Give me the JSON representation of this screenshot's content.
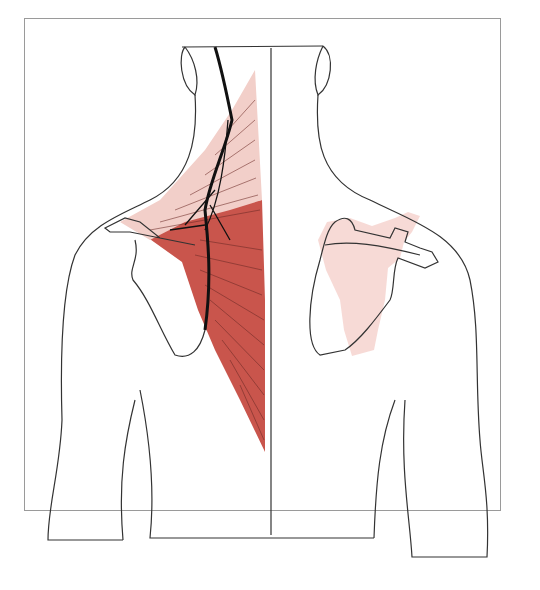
{
  "figure": {
    "type": "anatomical-illustration",
    "view": "posterior neck and shoulders",
    "panels": [
      {
        "side": "left",
        "content": "trapezius muscle with accessory nerve",
        "colors": {
          "muscle_upper": "#f2cfc9",
          "muscle_lower": "#c9554c",
          "nerve": "#1a1a1a"
        }
      },
      {
        "side": "right",
        "content": "scapula outline with referred pain zone",
        "colors": {
          "pain_zone": "#f6d6d2"
        }
      }
    ],
    "outline_color": "#333333",
    "frame_color": "#9a9a9a"
  },
  "caption": {
    "text": ""
  }
}
